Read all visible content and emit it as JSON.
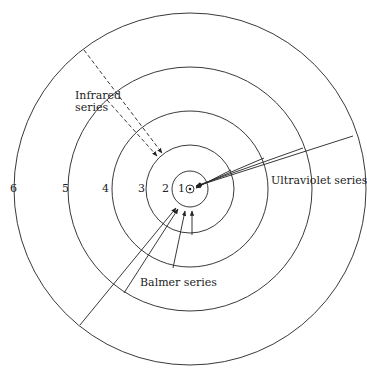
{
  "diagram": {
    "center": [
      190,
      189
    ],
    "orbits": [
      {
        "n": "1",
        "radius": 18
      },
      {
        "n": "2",
        "radius": 44
      },
      {
        "n": "3",
        "radius": 78
      },
      {
        "n": "4",
        "radius": 122
      },
      {
        "n": "5",
        "radius": 176
      }
    ],
    "nucleus_radius": 4,
    "level_labels": [
      {
        "text": "6",
        "x": 10,
        "y": 183
      },
      {
        "text": "5",
        "x": 62,
        "y": 183
      },
      {
        "text": "4",
        "x": 102,
        "y": 183
      },
      {
        "text": "3",
        "x": 138,
        "y": 183
      },
      {
        "text": "2",
        "x": 162,
        "y": 183
      },
      {
        "text": "1",
        "x": 178,
        "y": 183
      }
    ],
    "series_labels": {
      "infrared": {
        "line1": "Infrared",
        "line2": "series"
      },
      "ultraviolet": "Ultraviolet series",
      "balmer": "Balmer series"
    },
    "transitions": {
      "infrared": [
        {
          "from": [
            84,
            50
          ],
          "to": [
            162,
            153
          ]
        },
        {
          "from": [
            107,
            100
          ],
          "to": [
            157,
            156
          ]
        }
      ],
      "ultraviolet": [
        {
          "from": [
            353,
            136
          ],
          "to": [
            197,
            186
          ]
        },
        {
          "from": [
            303,
            148
          ],
          "to": [
            196,
            186
          ]
        },
        {
          "from": [
            264,
            158
          ],
          "to": [
            196,
            187
          ]
        },
        {
          "from": [
            231,
            170
          ],
          "to": [
            196,
            188
          ]
        }
      ],
      "balmer": [
        {
          "from": [
            80,
            325
          ],
          "to": [
            176,
            208
          ]
        },
        {
          "from": [
            124,
            293
          ],
          "to": [
            178,
            209
          ]
        },
        {
          "from": [
            173,
            268
          ],
          "to": [
            185,
            211
          ]
        },
        {
          "from": [
            192,
            235
          ],
          "to": [
            192,
            211
          ]
        }
      ]
    },
    "colors": {
      "stroke": "#222222",
      "background": "#ffffff"
    }
  }
}
